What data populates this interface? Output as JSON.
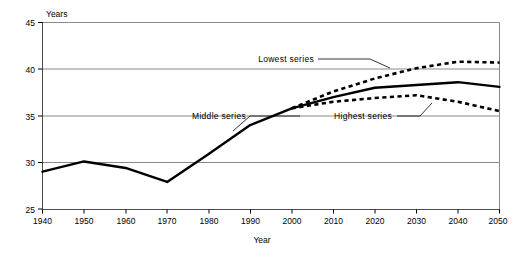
{
  "chart_data": {
    "type": "line",
    "title": "",
    "xlabel": "Year",
    "ylabel": "Years",
    "xlim": [
      1940,
      2050
    ],
    "ylim": [
      25,
      45
    ],
    "xticks": [
      1940,
      1950,
      1960,
      1970,
      1980,
      1990,
      2000,
      2010,
      2020,
      2030,
      2040,
      2050
    ],
    "yticks": [
      25,
      30,
      35,
      40,
      45
    ],
    "grid": "horizontal",
    "legend": "annotations",
    "x": [
      1940,
      1950,
      1960,
      1970,
      1980,
      1990,
      2000,
      2010,
      2020,
      2030,
      2040,
      2050
    ],
    "series": [
      {
        "name": "Middle series",
        "style": "solid",
        "x": [
          1940,
          1950,
          1960,
          1970,
          1980,
          1990,
          2000,
          2010,
          2020,
          2030,
          2040,
          2050
        ],
        "values": [
          29.0,
          30.1,
          29.4,
          27.9,
          30.9,
          34.0,
          35.8,
          37.0,
          38.0,
          38.3,
          38.6,
          38.1
        ]
      },
      {
        "name": "Lowest series",
        "style": "dashed",
        "x": [
          2000,
          2010,
          2020,
          2030,
          2040,
          2050
        ],
        "values": [
          35.8,
          37.6,
          39.0,
          40.1,
          40.8,
          40.7
        ]
      },
      {
        "name": "Highest series",
        "style": "dashed",
        "x": [
          2000,
          2010,
          2020,
          2030,
          2040,
          2050
        ],
        "values": [
          35.8,
          36.5,
          36.9,
          37.2,
          36.5,
          35.5
        ]
      }
    ],
    "annotations": [
      {
        "text": "Lowest series",
        "x": 2012,
        "y": 41.9
      },
      {
        "text": "Middle series",
        "x": 1977,
        "y": 35.0
      },
      {
        "text": "Highest series",
        "x": 2013,
        "y": 35.0
      }
    ]
  },
  "axes": {
    "y_title": "Years",
    "x_title": "Year",
    "y_tick_labels": [
      "45",
      "40",
      "35",
      "30",
      "25"
    ],
    "x_tick_labels": [
      "1940",
      "1950",
      "1960",
      "1970",
      "1980",
      "1990",
      "2000",
      "2010",
      "2020",
      "2030",
      "2040",
      "2050"
    ]
  },
  "annotations": {
    "lowest": "Lowest series",
    "middle": "Middle series",
    "highest": "Highest series"
  },
  "colors": {
    "line": "#000000",
    "grid": "#808080",
    "axis": "#4d4d4d",
    "background": "#ffffff"
  }
}
